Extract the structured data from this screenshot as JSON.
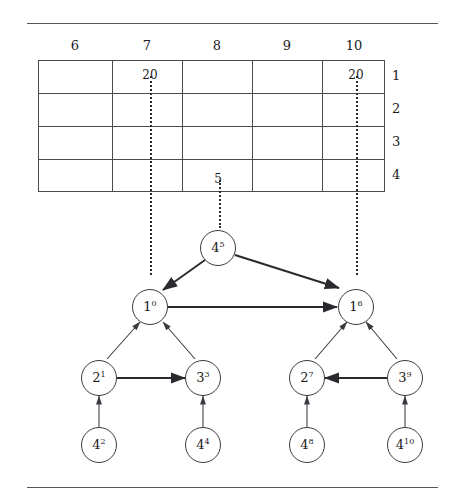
{
  "figure": {
    "title": "",
    "rules": [
      "top-rule",
      "bottom-rule"
    ]
  },
  "table": {
    "column_headers": [
      "6",
      "7",
      "8",
      "9",
      "10"
    ],
    "row_labels": [
      "1",
      "2",
      "3",
      "4"
    ],
    "rows": [
      [
        "",
        "20",
        "",
        "",
        "20"
      ],
      [
        "",
        "",
        "",
        "",
        ""
      ],
      [
        "",
        "",
        "",
        "",
        ""
      ],
      [
        "",
        "",
        "5",
        "",
        ""
      ]
    ]
  },
  "connectors": [
    {
      "name": "dotted-col7-to-node-1-0",
      "column": "7"
    },
    {
      "name": "dotted-col8-to-node-4-5",
      "column": "8"
    },
    {
      "name": "dotted-col10-to-node-1-6",
      "column": "10"
    }
  ],
  "graph": {
    "nodes": [
      {
        "id": "n45",
        "base": "4",
        "exp": "5"
      },
      {
        "id": "n10",
        "base": "1",
        "exp": "0"
      },
      {
        "id": "n16",
        "base": "1",
        "exp": "6"
      },
      {
        "id": "n21",
        "base": "2",
        "exp": "1"
      },
      {
        "id": "n33",
        "base": "3",
        "exp": "3"
      },
      {
        "id": "n27",
        "base": "2",
        "exp": "7"
      },
      {
        "id": "n39",
        "base": "3",
        "exp": "9"
      },
      {
        "id": "n42",
        "base": "4",
        "exp": "2"
      },
      {
        "id": "n44",
        "base": "4",
        "exp": "4"
      },
      {
        "id": "n48",
        "base": "4",
        "exp": "8"
      },
      {
        "id": "n410",
        "base": "4",
        "exp": "10"
      }
    ],
    "edges": [
      {
        "from": "n45",
        "to": "n10",
        "weight": "thick"
      },
      {
        "from": "n45",
        "to": "n16",
        "weight": "thick"
      },
      {
        "from": "n10",
        "to": "n16",
        "weight": "thick"
      },
      {
        "from": "n21",
        "to": "n33",
        "weight": "thick"
      },
      {
        "from": "n39",
        "to": "n27",
        "weight": "thick"
      },
      {
        "from": "n21",
        "to": "n10",
        "weight": "thin"
      },
      {
        "from": "n33",
        "to": "n10",
        "weight": "thin"
      },
      {
        "from": "n27",
        "to": "n16",
        "weight": "thin"
      },
      {
        "from": "n39",
        "to": "n16",
        "weight": "thin"
      },
      {
        "from": "n42",
        "to": "n21",
        "weight": "thin"
      },
      {
        "from": "n44",
        "to": "n33",
        "weight": "thin"
      },
      {
        "from": "n48",
        "to": "n27",
        "weight": "thin"
      },
      {
        "from": "n410",
        "to": "n39",
        "weight": "thin"
      }
    ]
  },
  "colors": {
    "line": "#3a3a40",
    "rule": "#55555a",
    "text": "#1a1a1a",
    "background": "#ffffff"
  }
}
